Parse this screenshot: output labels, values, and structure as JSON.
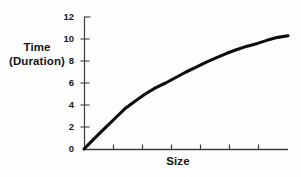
{
  "chart_data": {
    "type": "line",
    "title": "",
    "subtitle": "",
    "xlabel": "Size",
    "ylabel_lines": [
      "Time",
      "(Duration)"
    ],
    "ylabel": "Time (Duration)",
    "xlim": [
      0,
      7
    ],
    "ylim": [
      0,
      12
    ],
    "grid": false,
    "legend": null,
    "y_ticks": [
      0,
      2,
      4,
      6,
      8,
      10,
      12
    ],
    "y_tick_labels": [
      "0",
      "2",
      "4",
      "6",
      "8",
      "10",
      "12"
    ],
    "x_ticks": [
      1,
      2,
      3,
      4,
      5,
      6
    ],
    "x_tick_labels": [
      "",
      "",
      "",
      "",
      "",
      ""
    ],
    "annotations": [],
    "series": [
      {
        "name": "Time vs Size",
        "color": "#0d0d0d",
        "line_width": 3.1,
        "x": [
          0.0,
          0.35,
          0.7,
          1.05,
          1.4,
          1.75,
          2.1,
          2.45,
          2.8,
          3.15,
          3.5,
          3.85,
          4.2,
          4.55,
          4.9,
          5.25,
          5.6,
          5.95,
          6.3,
          6.65,
          7.0
        ],
        "values": [
          0.0,
          0.95,
          1.85,
          2.75,
          3.65,
          4.35,
          5.0,
          5.55,
          6.0,
          6.5,
          7.0,
          7.45,
          7.9,
          8.3,
          8.7,
          9.05,
          9.35,
          9.6,
          9.9,
          10.15,
          10.3
        ]
      }
    ]
  },
  "axes": {
    "axis_color": "#3c3c3c",
    "axis_width": 1.1,
    "tick_length": 4,
    "x_tick_length": 4
  },
  "style": {
    "background": "#fefefe",
    "text_color": "#141414"
  }
}
